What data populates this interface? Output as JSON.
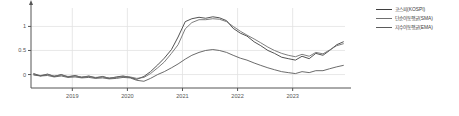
{
  "chart_data": {
    "type": "line",
    "title": "",
    "subtitle": "",
    "xlabel": "",
    "ylabel": "",
    "xlim": [
      2018.25,
      2023.95
    ],
    "ylim": [
      -0.28,
      1.3
    ],
    "xticks": [
      2019,
      2020,
      2021,
      2022,
      2023
    ],
    "xtick_labels": [
      "2019",
      "2020",
      "2021",
      "2022",
      "2023"
    ],
    "yticks": [
      0,
      0.5,
      1
    ],
    "ytick_labels": [
      "0",
      "0.5",
      "1"
    ],
    "grid": true,
    "grid_axis": "both",
    "legend_position": "right-top",
    "x": [
      2018.3,
      2018.42,
      2018.55,
      2018.67,
      2018.8,
      2018.92,
      2019.05,
      2019.17,
      2019.3,
      2019.42,
      2019.55,
      2019.67,
      2019.8,
      2019.92,
      2020.05,
      2020.17,
      2020.3,
      2020.42,
      2020.55,
      2020.67,
      2020.8,
      2020.92,
      2021.05,
      2021.17,
      2021.3,
      2021.42,
      2021.55,
      2021.67,
      2021.8,
      2021.92,
      2022.05,
      2022.17,
      2022.3,
      2022.42,
      2022.55,
      2022.67,
      2022.8,
      2022.92,
      2023.05,
      2023.17,
      2023.3,
      2023.42,
      2023.55,
      2023.67,
      2023.8,
      2023.92
    ],
    "series": [
      {
        "name": "코스피(KOSPI)",
        "label": "코스피(KOSPI)",
        "color": "#3f3f3f",
        "values": [
          0.02,
          -0.03,
          0.01,
          -0.04,
          0.0,
          -0.05,
          -0.02,
          -0.06,
          -0.03,
          -0.07,
          -0.04,
          -0.08,
          -0.05,
          -0.03,
          -0.06,
          -0.1,
          -0.04,
          0.06,
          0.2,
          0.34,
          0.52,
          0.78,
          1.1,
          1.16,
          1.19,
          1.17,
          1.2,
          1.18,
          1.12,
          0.96,
          0.86,
          0.8,
          0.68,
          0.6,
          0.5,
          0.44,
          0.36,
          0.33,
          0.3,
          0.38,
          0.33,
          0.44,
          0.4,
          0.5,
          0.62,
          0.68
        ]
      },
      {
        "name": "단순이동평균(SMA)",
        "label": "단순이동평균(SMA)",
        "color": "#6f6f6f",
        "values": [
          0.0,
          -0.02,
          0.0,
          -0.03,
          -0.01,
          -0.04,
          -0.03,
          -0.05,
          -0.04,
          -0.06,
          -0.05,
          -0.07,
          -0.06,
          -0.04,
          -0.05,
          -0.08,
          -0.06,
          0.02,
          0.14,
          0.26,
          0.44,
          0.62,
          0.95,
          1.08,
          1.14,
          1.14,
          1.16,
          1.15,
          1.1,
          1.0,
          0.9,
          0.82,
          0.74,
          0.66,
          0.57,
          0.5,
          0.44,
          0.4,
          0.37,
          0.42,
          0.38,
          0.46,
          0.43,
          0.51,
          0.6,
          0.64
        ]
      },
      {
        "name": "지수이동평균(EMA)",
        "label": "지수이동평균(EMA)",
        "color": "#5a5a5a",
        "values": [
          -0.01,
          -0.03,
          -0.02,
          -0.05,
          -0.03,
          -0.06,
          -0.05,
          -0.07,
          -0.06,
          -0.08,
          -0.07,
          -0.09,
          -0.08,
          -0.06,
          -0.07,
          -0.12,
          -0.14,
          -0.08,
          0.0,
          0.06,
          0.14,
          0.22,
          0.32,
          0.4,
          0.46,
          0.5,
          0.52,
          0.5,
          0.46,
          0.4,
          0.34,
          0.3,
          0.24,
          0.19,
          0.14,
          0.1,
          0.06,
          0.04,
          0.02,
          0.06,
          0.04,
          0.08,
          0.08,
          0.12,
          0.16,
          0.19
        ]
      }
    ]
  },
  "legend": {
    "items": [
      {
        "label": "코스피(KOSPI)",
        "color": "#3f3f3f"
      },
      {
        "label": "단순이동평균(SMA)",
        "color": "#6f6f6f"
      },
      {
        "label": "지수이동평균(EMA)",
        "color": "#5a5a5a"
      }
    ]
  },
  "caption": {
    "text": ""
  },
  "colors": {
    "axis": "#555555",
    "grid": "#e2e2e2",
    "background": "#ffffff"
  }
}
